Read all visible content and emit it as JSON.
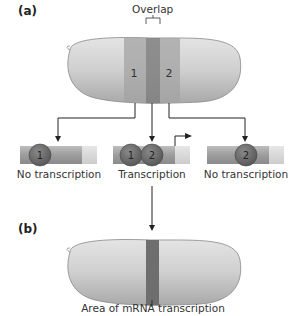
{
  "panels": {
    "a": {
      "label": "(a)",
      "overlap_label": "Overlap",
      "band1_label": "1",
      "band2_label": "2"
    },
    "b": {
      "label": "(b)",
      "caption": "Area of mRNA transcription"
    }
  },
  "promoters": [
    {
      "bound": [
        "1"
      ],
      "caption": "No transcription"
    },
    {
      "bound": [
        "1",
        "2"
      ],
      "caption": "Transcription"
    },
    {
      "bound": [
        "2"
      ],
      "caption": "No transcription"
    }
  ],
  "colors": {
    "embryo": "#c9c9c9",
    "band": "#a8a8a8",
    "overlap": "#7a7a7a",
    "protein": "#6b6b6b",
    "dna": "#9a9a9a",
    "dna_light": "#d8d8d8"
  }
}
